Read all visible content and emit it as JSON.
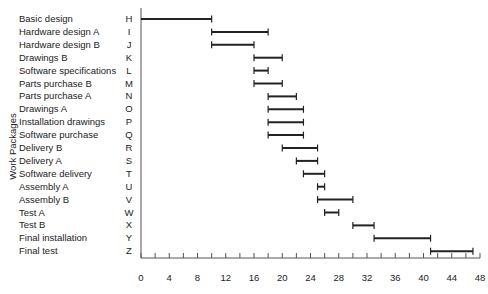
{
  "chart_data": {
    "type": "gantt",
    "title": "",
    "ylabel": "Work Packages",
    "xlabel": "",
    "xlim": [
      0,
      48
    ],
    "x_ticks": [
      0,
      4,
      8,
      12,
      16,
      20,
      24,
      28,
      32,
      36,
      40,
      44,
      48
    ],
    "x_minor_tick_step": 2,
    "grid": false,
    "tasks": [
      {
        "name": "Basic design",
        "code": "H",
        "start": 0,
        "end": 10
      },
      {
        "name": "Hardware design A",
        "code": "I",
        "start": 10,
        "end": 18
      },
      {
        "name": "Hardware design B",
        "code": "J",
        "start": 10,
        "end": 16
      },
      {
        "name": "Drawings B",
        "code": "K",
        "start": 16,
        "end": 20
      },
      {
        "name": "Software specifications",
        "code": "L",
        "start": 16,
        "end": 18
      },
      {
        "name": "Parts purchase B",
        "code": "M",
        "start": 16,
        "end": 20
      },
      {
        "name": "Parts purchase A",
        "code": "N",
        "start": 18,
        "end": 22
      },
      {
        "name": "Drawings A",
        "code": "O",
        "start": 18,
        "end": 23
      },
      {
        "name": "Installation drawings",
        "code": "P",
        "start": 18,
        "end": 23
      },
      {
        "name": "Software purchase",
        "code": "Q",
        "start": 18,
        "end": 23
      },
      {
        "name": "Delivery B",
        "code": "R",
        "start": 20,
        "end": 25
      },
      {
        "name": "Delivery A",
        "code": "S",
        "start": 22,
        "end": 25
      },
      {
        "name": "Software delivery",
        "code": "T",
        "start": 23,
        "end": 26
      },
      {
        "name": "Assembly A",
        "code": "U",
        "start": 25,
        "end": 26
      },
      {
        "name": "Assembly B",
        "code": "V",
        "start": 25,
        "end": 30
      },
      {
        "name": "Test A",
        "code": "W",
        "start": 26,
        "end": 28
      },
      {
        "name": "Test B",
        "code": "X",
        "start": 30,
        "end": 33
      },
      {
        "name": "Final installation",
        "code": "Y",
        "start": 33,
        "end": 41
      },
      {
        "name": "Final test",
        "code": "Z",
        "start": 41,
        "end": 47
      }
    ]
  },
  "colors": {
    "bar": "#222222",
    "axis": "#555555",
    "text": "#222222"
  }
}
